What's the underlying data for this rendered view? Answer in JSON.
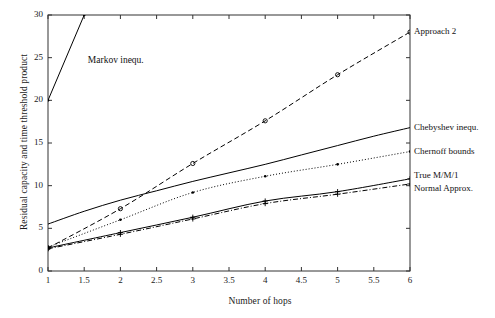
{
  "chart_data": {
    "type": "line",
    "title": "",
    "xlabel": "Number of hops",
    "ylabel": "Residual capacity and time threshold product",
    "xlim": [
      1,
      6
    ],
    "ylim": [
      0,
      30
    ],
    "xticks": [
      "1",
      "1.5",
      "2",
      "2.5",
      "3",
      "3.5",
      "4",
      "4.5",
      "5",
      "5.5",
      "6"
    ],
    "xtick_values": [
      1,
      1.5,
      2,
      2.5,
      3,
      3.5,
      4,
      4.5,
      5,
      5.5,
      6
    ],
    "yticks": [
      "0",
      "5",
      "10",
      "15",
      "20",
      "25",
      "30"
    ],
    "ytick_values": [
      0,
      5,
      10,
      15,
      20,
      25,
      30
    ],
    "grid": false,
    "legend_position": "right-inline-annotations",
    "series": [
      {
        "name": "Markov inequ.",
        "label_placement": "inside-plot",
        "style": "solid",
        "color": "#000000",
        "marker": "dot",
        "x": [
          1,
          1.5
        ],
        "values": [
          20,
          30
        ]
      },
      {
        "name": "Approach 2",
        "label_placement": "right-edge",
        "style": "dashed",
        "color": "#000000",
        "marker": "circle",
        "x": [
          1,
          2,
          3,
          4,
          5,
          6
        ],
        "values": [
          2.7,
          7.3,
          12.6,
          17.6,
          23.0,
          28.0
        ]
      },
      {
        "name": "Chebyshev inequ.",
        "label_placement": "right-edge",
        "style": "solid",
        "color": "#000000",
        "marker": "none",
        "x": [
          1,
          1.5,
          2,
          2.5,
          3,
          3.5,
          4,
          4.5,
          5,
          5.5,
          6
        ],
        "values": [
          5.5,
          7.0,
          8.3,
          9.4,
          10.5,
          11.5,
          12.5,
          13.6,
          14.7,
          15.8,
          16.8
        ]
      },
      {
        "name": "Chernoff bounds",
        "label_placement": "right-edge",
        "style": "dotted",
        "color": "#000000",
        "marker": "dot",
        "x": [
          1,
          2,
          3,
          4,
          5,
          6
        ],
        "values": [
          2.8,
          6.0,
          9.2,
          11.1,
          12.5,
          14.0
        ]
      },
      {
        "name": "True M/M/1",
        "label_placement": "right-edge",
        "style": "solid",
        "color": "#000000",
        "marker": "plus",
        "x": [
          1,
          2,
          3,
          4,
          5,
          6
        ],
        "values": [
          2.7,
          4.5,
          6.3,
          8.2,
          9.3,
          10.8
        ]
      },
      {
        "name": "Normal Approx.",
        "label_placement": "right-edge",
        "style": "dashdot",
        "color": "#000000",
        "marker": "plus",
        "x": [
          1,
          2,
          3,
          4,
          5,
          6
        ],
        "values": [
          2.6,
          4.3,
          6.1,
          7.9,
          9.0,
          10.2
        ]
      }
    ],
    "annotations": [
      {
        "text": "Markov inequ.",
        "x": 1.55,
        "y": 24.6
      }
    ],
    "axis_color": "#333333",
    "background": "#ffffff"
  }
}
